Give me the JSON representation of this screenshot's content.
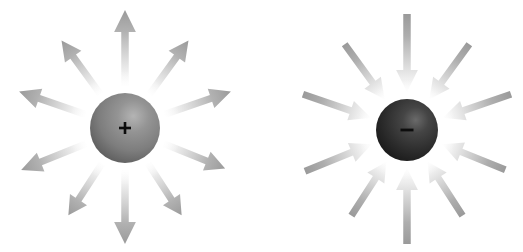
{
  "figure": {
    "background_color": "#ffffff",
    "width": 523,
    "height": 252
  },
  "panels": [
    {
      "id": "positive-charge-panel",
      "label": "Positive point charge with outward radial field",
      "sign_symbol": "+",
      "sign_name": "plus-sign",
      "field_direction": "outward",
      "sphere": {
        "name": "positive-charge-sphere",
        "cx": 125,
        "cy": 128,
        "r": 35,
        "base_color": "#7d7d7d",
        "highlight_color": "#b4b4b4",
        "shadow_color": "#4a4a4a",
        "highlight_offset": {
          "fx": 0.62,
          "fy": 0.33
        }
      },
      "arrow_color": "#a8a8a8",
      "arrows": [
        {
          "name": "arrow-up",
          "angle_deg": -90,
          "start_r": 42,
          "end_r": 118,
          "width": 7.5
        },
        {
          "name": "arrow-upper-right",
          "angle_deg": -54,
          "start_r": 42,
          "end_r": 108,
          "width": 7.0
        },
        {
          "name": "arrow-right-upper",
          "angle_deg": -19,
          "start_r": 42,
          "end_r": 112,
          "width": 7.0
        },
        {
          "name": "arrow-right-lower",
          "angle_deg": 22,
          "start_r": 42,
          "end_r": 108,
          "width": 7.0
        },
        {
          "name": "arrow-lower-right",
          "angle_deg": 57,
          "start_r": 42,
          "end_r": 104,
          "width": 7.0
        },
        {
          "name": "arrow-down",
          "angle_deg": 90,
          "start_r": 42,
          "end_r": 116,
          "width": 7.5
        },
        {
          "name": "arrow-lower-left",
          "angle_deg": 123,
          "start_r": 42,
          "end_r": 104,
          "width": 7.0
        },
        {
          "name": "arrow-left-lower",
          "angle_deg": 158,
          "start_r": 42,
          "end_r": 112,
          "width": 7.0
        },
        {
          "name": "arrow-left-upper",
          "angle_deg": -161,
          "start_r": 42,
          "end_r": 112,
          "width": 7.0
        },
        {
          "name": "arrow-upper-left",
          "angle_deg": -126,
          "start_r": 42,
          "end_r": 108,
          "width": 7.0
        }
      ]
    },
    {
      "id": "negative-charge-panel",
      "label": "Negative point charge with inward radial field",
      "sign_symbol": "–",
      "sign_name": "minus-sign",
      "field_direction": "inward",
      "sphere": {
        "name": "negative-charge-sphere",
        "cx": 407,
        "cy": 130,
        "r": 31,
        "base_color": "#2e2e2e",
        "highlight_color": "#6a6a6a",
        "shadow_color": "#141414",
        "highlight_offset": {
          "fx": 0.64,
          "fy": 0.34
        }
      },
      "arrow_color": "#a8a8a8",
      "arrows": [
        {
          "name": "arrow-from-top",
          "angle_deg": -90,
          "start_r": 38,
          "end_r": 116,
          "width": 7.5
        },
        {
          "name": "arrow-from-upper-right",
          "angle_deg": -54,
          "start_r": 38,
          "end_r": 106,
          "width": 7.0
        },
        {
          "name": "arrow-from-right-upper",
          "angle_deg": -19,
          "start_r": 38,
          "end_r": 110,
          "width": 7.0
        },
        {
          "name": "arrow-from-right-lower",
          "angle_deg": 22,
          "start_r": 38,
          "end_r": 106,
          "width": 7.0
        },
        {
          "name": "arrow-from-lower-right",
          "angle_deg": 57,
          "start_r": 38,
          "end_r": 102,
          "width": 7.0
        },
        {
          "name": "arrow-from-bottom",
          "angle_deg": 90,
          "start_r": 38,
          "end_r": 114,
          "width": 7.5
        },
        {
          "name": "arrow-from-lower-left",
          "angle_deg": 123,
          "start_r": 38,
          "end_r": 102,
          "width": 7.0
        },
        {
          "name": "arrow-from-left-lower",
          "angle_deg": 158,
          "start_r": 38,
          "end_r": 110,
          "width": 7.0
        },
        {
          "name": "arrow-from-left-upper",
          "angle_deg": -161,
          "start_r": 38,
          "end_r": 110,
          "width": 7.0
        },
        {
          "name": "arrow-from-upper-left",
          "angle_deg": -126,
          "start_r": 38,
          "end_r": 106,
          "width": 7.0
        }
      ]
    }
  ]
}
